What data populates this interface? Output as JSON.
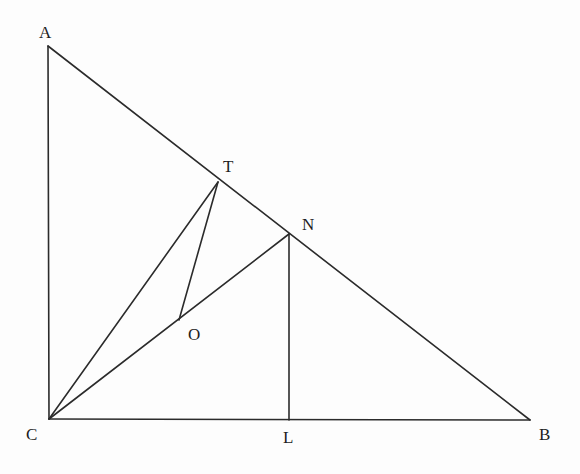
{
  "figure": {
    "type": "geometry-diagram",
    "stroke_color": "#2b2b2b",
    "label_color": "#1e1e1e",
    "background": "#fdfdfd",
    "points": {
      "A": {
        "x": 48,
        "y": 46,
        "label": "A",
        "lx": 39,
        "ly": 38
      },
      "B": {
        "x": 530,
        "y": 420,
        "label": "B",
        "lx": 539,
        "ly": 440
      },
      "C": {
        "x": 49,
        "y": 419,
        "label": "C",
        "lx": 26,
        "ly": 440
      },
      "T": {
        "x": 218,
        "y": 182,
        "label": "T",
        "lx": 223,
        "ly": 172
      },
      "N": {
        "x": 289,
        "y": 234,
        "label": "N",
        "lx": 302,
        "ly": 230
      },
      "O": {
        "x": 179,
        "y": 320,
        "label": "O",
        "lx": 188,
        "ly": 340
      },
      "L": {
        "x": 289,
        "y": 420,
        "label": "L",
        "lx": 283,
        "ly": 443
      }
    },
    "segments": [
      {
        "id": "AC",
        "from": "A",
        "to": "C"
      },
      {
        "id": "AB",
        "from": "A",
        "to": "B"
      },
      {
        "id": "CB",
        "from": "C",
        "to": "B"
      },
      {
        "id": "CT",
        "from": "C",
        "to": "T"
      },
      {
        "id": "CN",
        "from": "C",
        "to": "N"
      },
      {
        "id": "TO",
        "from": "T",
        "to": "O"
      },
      {
        "id": "NL",
        "from": "N",
        "to": "L"
      }
    ]
  }
}
